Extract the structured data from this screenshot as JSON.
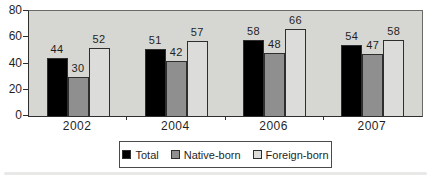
{
  "chart_data": {
    "type": "bar",
    "categories": [
      "2002",
      "2004",
      "2006",
      "2007"
    ],
    "series": [
      {
        "name": "Total",
        "color": "#000000",
        "values": [
          44,
          51,
          58,
          54
        ]
      },
      {
        "name": "Native-born",
        "color": "#8f8f8f",
        "values": [
          30,
          42,
          48,
          47
        ]
      },
      {
        "name": "Foreign-born",
        "color": "#dcdcda",
        "values": [
          52,
          57,
          66,
          58
        ]
      }
    ],
    "ylim": [
      0,
      80
    ],
    "yticks": [
      0,
      20,
      40,
      60,
      80
    ],
    "grid": false,
    "value_labels_shown": true,
    "legend_position": "bottom-boxed",
    "plot_background": "#d6d6d2",
    "bar_border_color": "#2e2e2e",
    "axis_color": "#2f2f2f",
    "text_color": "#1f1f1f"
  }
}
